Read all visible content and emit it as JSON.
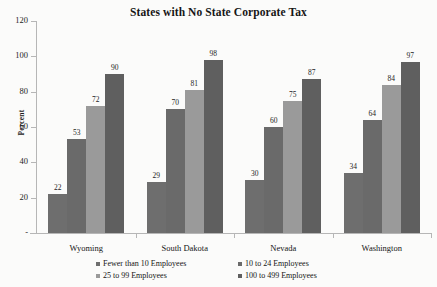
{
  "chart_data": {
    "type": "bar",
    "title": "States with No State Corporate Tax",
    "xlabel": "",
    "ylabel": "Percent",
    "ylim": [
      0,
      120
    ],
    "yticks": [
      "-",
      "20",
      "40",
      "60",
      "80",
      "100",
      "120"
    ],
    "grid": false,
    "legend_position": "bottom",
    "categories": [
      "Wyoming",
      "South Dakota",
      "Nevada",
      "Washington"
    ],
    "series": [
      {
        "name": "Fewer than 10 Employees",
        "color": "#6e6e6e",
        "values": [
          22,
          29,
          30,
          34
        ]
      },
      {
        "name": "10 to 24 Employees",
        "color": "#6a6a6a",
        "values": [
          53,
          70,
          60,
          64
        ]
      },
      {
        "name": "25 to 99 Employees",
        "color": "#9a9a9a",
        "values": [
          72,
          81,
          75,
          84
        ]
      },
      {
        "name": "100 to 499 Employees",
        "color": "#5f5f5f",
        "values": [
          90,
          98,
          87,
          97
        ]
      }
    ]
  }
}
